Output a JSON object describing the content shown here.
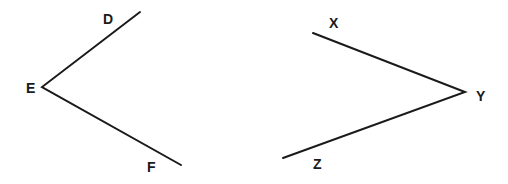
{
  "diagram": {
    "angles": [
      {
        "name": "angle DEF",
        "vertex": {
          "label": "E",
          "x": 42,
          "y": 87
        },
        "rays": [
          {
            "label": "D",
            "x": 140,
            "y": 12,
            "label_x": 103,
            "label_y": 24
          },
          {
            "label": "F",
            "x": 181,
            "y": 165,
            "label_x": 147,
            "label_y": 172
          }
        ],
        "vertex_label_x": 26,
        "vertex_label_y": 93
      },
      {
        "name": "angle XYZ",
        "vertex": {
          "label": "Y",
          "x": 465,
          "y": 92
        },
        "rays": [
          {
            "label": "X",
            "x": 313,
            "y": 33,
            "label_x": 329,
            "label_y": 28
          },
          {
            "label": "Z",
            "x": 283,
            "y": 158,
            "label_x": 313,
            "label_y": 169
          }
        ],
        "vertex_label_x": 476,
        "vertex_label_y": 101
      }
    ],
    "line_color": "#1a1a1a"
  }
}
